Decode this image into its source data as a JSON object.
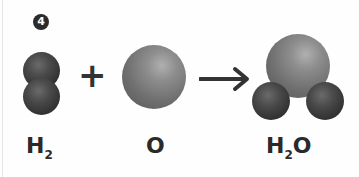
{
  "figure": {
    "step_badge": "4",
    "reactants": [
      {
        "id": "hydrogen",
        "label_main": "H",
        "label_sub": "2",
        "atoms": [
          "H",
          "H"
        ]
      },
      {
        "id": "oxygen",
        "label_main": "O",
        "label_sub": "",
        "atoms": [
          "O"
        ]
      }
    ],
    "operator": "+",
    "arrow": "→",
    "product": {
      "id": "water",
      "label_main": "H",
      "label_sub": "2",
      "label_tail": "O",
      "atoms": [
        "O",
        "H",
        "H"
      ]
    },
    "colors": {
      "hydrogen_atom": "#333333",
      "oxygen_atom": "#7a7a7a",
      "text": "#2a2a2a"
    }
  }
}
